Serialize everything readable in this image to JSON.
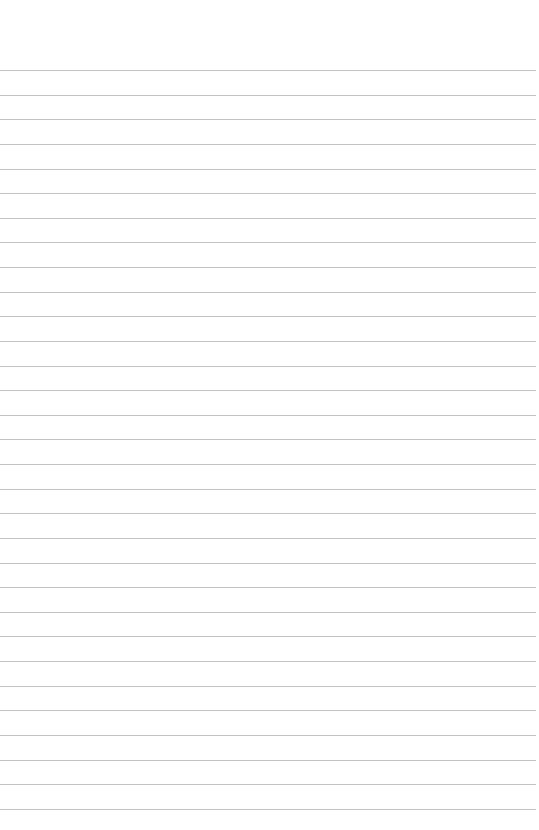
{
  "page": {
    "type": "lined-paper",
    "background_color": "#ffffff",
    "rule_color": "#b9b9b9",
    "rule_count": 31,
    "first_rule_y": 70,
    "rule_spacing": 24.63,
    "rule_left": 0,
    "rule_right": 536,
    "text": []
  }
}
